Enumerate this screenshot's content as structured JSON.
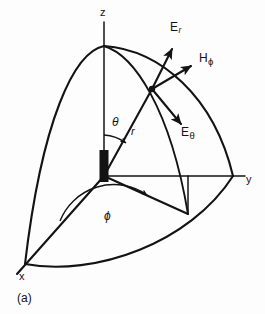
{
  "figure": {
    "caption": "(a)",
    "background_color": "#fdfdfd",
    "ink_color": "#131313"
  },
  "axes": [
    {
      "name": "z",
      "label": "z"
    },
    {
      "name": "y",
      "label": "y"
    },
    {
      "name": "x",
      "label": "x"
    }
  ],
  "angles": [
    {
      "name": "theta",
      "label": "θ"
    },
    {
      "name": "phi",
      "label": "ϕ"
    }
  ],
  "radial": {
    "label": "r"
  },
  "field_vectors": [
    {
      "name": "E-radial",
      "base": "E",
      "subscript": "r",
      "subscript_type": "latin"
    },
    {
      "name": "H-phi",
      "base": "H",
      "subscript": "ϕ",
      "subscript_type": "greek"
    },
    {
      "name": "E-theta",
      "base": "E",
      "subscript": "θ",
      "subscript_type": "greek"
    }
  ],
  "antenna": {
    "name": "dipole-element"
  }
}
